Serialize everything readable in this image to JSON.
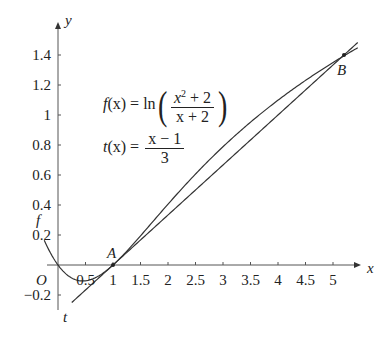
{
  "chart_data": {
    "type": "line",
    "title": "",
    "xlabel": "x",
    "ylabel": "y",
    "origin_label": "O",
    "xlim": [
      -0.2,
      5.4
    ],
    "ylim": [
      -0.3,
      1.55
    ],
    "x_ticks": [
      0.5,
      1,
      1.5,
      2,
      2.5,
      3,
      3.5,
      4,
      4.5,
      5
    ],
    "x_tick_labels": [
      "0.5",
      "1",
      "1.5",
      "2",
      "2.5",
      "3",
      "3.5",
      "4",
      "4.5",
      "5"
    ],
    "y_ticks": [
      -0.2,
      0.2,
      0.4,
      0.6,
      0.8,
      1,
      1.2,
      1.4
    ],
    "y_tick_labels": [
      "−0.2",
      "0.2",
      "0.4",
      "0.6",
      "0.8",
      "1",
      "1.2",
      "1.4"
    ],
    "grid": false,
    "series": [
      {
        "name": "f",
        "formula": "ln((x^2+2)/(x+2))",
        "x_range": [
          -0.25,
          5.45
        ],
        "label": "f"
      },
      {
        "name": "t",
        "formula": "(x-1)/3",
        "x_range": [
          0.25,
          5.45
        ],
        "label": "t"
      }
    ],
    "points": [
      {
        "label": "A",
        "x": 1,
        "y": 0
      },
      {
        "label": "B",
        "x": 5.2,
        "y": 1.4
      }
    ],
    "annotations": [
      "f(x) = ln((x^2 + 2)/(x + 2))",
      "t(x) = (x − 1)/3"
    ]
  },
  "formulas": {
    "f": {
      "lhs": "f",
      "arg": "(x)",
      "eq": " = ln",
      "num_base": "x",
      "num_exp": "2",
      "num_rest": " + 2",
      "den": "x + 2"
    },
    "t": {
      "lhs": "t",
      "arg": "(x)",
      "eq": " = ",
      "num": "x − 1",
      "den": "3"
    }
  }
}
